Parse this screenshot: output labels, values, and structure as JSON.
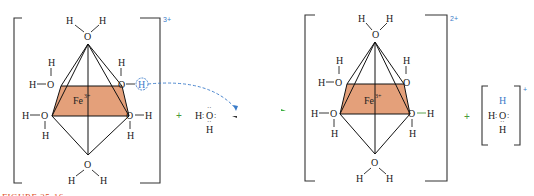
{
  "reactant_complex": {
    "metal": "Fe",
    "metal_charge": "3+",
    "complex_charge": "3+",
    "ligands": [
      "H2O",
      "H2O",
      "H2O",
      "H2O",
      "H2O",
      "H2O"
    ],
    "atoms": {
      "O": "O",
      "H": "H"
    },
    "highlighted_proton": "H"
  },
  "operator_plus_1": "+",
  "water": {
    "H_left": "H",
    "O": "O",
    "H_bottom": "H"
  },
  "equilibrium_arrow": "⇌",
  "product_complex": {
    "metal": "Fe",
    "metal_charge": "2+",
    "complex_charge": "2+",
    "atoms": {
      "O": "O",
      "H": "H"
    }
  },
  "operator_plus_2": "+",
  "hydronium": {
    "H_top": "H",
    "H_left": "H",
    "O": "O",
    "H_bottom": "H",
    "charge": "+"
  },
  "caption": "FIGURE 25-16",
  "colors": {
    "octahedron_plane": "#e4a07a",
    "accent_blue": "#3a7bc8",
    "caption": "#e0502a",
    "plus_green": "#4a9a3a"
  }
}
